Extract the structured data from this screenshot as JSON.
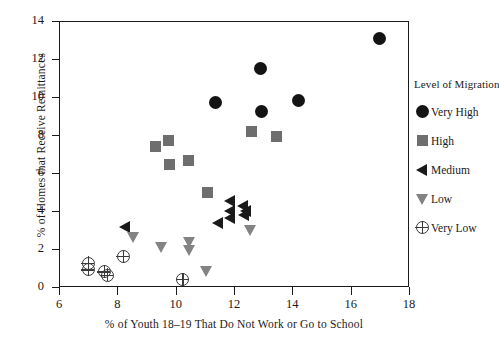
{
  "chart_data": {
    "type": "scatter",
    "title": "",
    "xlabel": "% of Youth 18–19 That Do Not Work or Go to School",
    "ylabel": "% of Homes that Receive Remittances",
    "xlim": [
      6,
      18
    ],
    "ylim": [
      0,
      14
    ],
    "xticks": [
      6,
      8,
      10,
      12,
      14,
      16,
      18
    ],
    "yticks": [
      0,
      2,
      4,
      6,
      8,
      10,
      12,
      14
    ],
    "grid": false,
    "legend_position": "right",
    "legend_title": "Level of Migration",
    "series": [
      {
        "name": "Very High",
        "marker": "circle",
        "color": "#141414",
        "points": [
          [
            11.35,
            9.7
          ],
          [
            12.9,
            11.5
          ],
          [
            12.95,
            9.25
          ],
          [
            14.2,
            9.8
          ],
          [
            17.0,
            13.1
          ]
        ]
      },
      {
        "name": "High",
        "marker": "square",
        "color": "#6e6e6e",
        "points": [
          [
            9.3,
            7.4
          ],
          [
            9.75,
            7.7
          ],
          [
            9.8,
            6.45
          ],
          [
            10.45,
            6.65
          ],
          [
            11.1,
            5.0
          ],
          [
            12.6,
            8.2
          ],
          [
            13.45,
            7.9
          ]
        ]
      },
      {
        "name": "Medium",
        "marker": "triangle-left",
        "color": "#1a1a1a",
        "points": [
          [
            8.25,
            3.15
          ],
          [
            11.45,
            3.35
          ],
          [
            11.85,
            4.55
          ],
          [
            11.85,
            4.0
          ],
          [
            11.85,
            3.65
          ],
          [
            12.3,
            4.25
          ],
          [
            12.35,
            3.8
          ],
          [
            12.4,
            4.0
          ]
        ]
      },
      {
        "name": "Low",
        "marker": "triangle-down",
        "color": "#838383",
        "points": [
          [
            8.55,
            2.65
          ],
          [
            9.5,
            2.1
          ],
          [
            10.45,
            2.35
          ],
          [
            10.45,
            1.95
          ],
          [
            11.05,
            0.85
          ],
          [
            12.55,
            3.0
          ]
        ]
      },
      {
        "name": "Very Low",
        "marker": "cross-circle",
        "color": "#3a3a3a",
        "points": [
          [
            7.0,
            1.25
          ],
          [
            7.0,
            0.9
          ],
          [
            7.55,
            0.8
          ],
          [
            7.65,
            0.62
          ],
          [
            8.2,
            1.6
          ],
          [
            10.25,
            0.4
          ]
        ]
      }
    ]
  },
  "axes": {
    "y_tick_labels": [
      "14",
      "12",
      "10",
      "8",
      "6",
      "4",
      "2",
      "0"
    ],
    "x_tick_labels": [
      "6",
      "8",
      "10",
      "12",
      "14",
      "16",
      "18"
    ],
    "y_axis_title": "% of Homes that Receive Remittances",
    "x_axis_title": "% of Youth 18–19 That Do Not Work or Go to School"
  },
  "legend": {
    "title": "Level of Migration",
    "items": [
      {
        "label": "Very High",
        "marker": "circle"
      },
      {
        "label": "High",
        "marker": "square"
      },
      {
        "label": "Medium",
        "marker": "triangle-left"
      },
      {
        "label": "Low",
        "marker": "triangle-down"
      },
      {
        "label": "Very Low",
        "marker": "cross-circle"
      }
    ]
  }
}
